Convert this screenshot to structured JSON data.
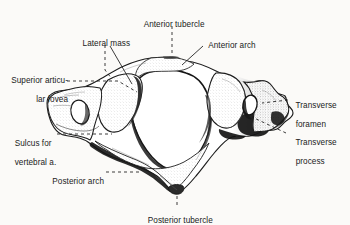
{
  "figure": {
    "view": "superior",
    "background_color": "#fbfaf8",
    "ink_color": "#1a1a1a",
    "style": "pen-and-ink anatomical line drawing with stipple shading"
  },
  "labels": [
    {
      "id": "anterior-tubercle",
      "text": "Anterior tubercle",
      "line1": "Anterior tubercle",
      "line2": ""
    },
    {
      "id": "lateral-mass",
      "text": "Lateral mass",
      "line1": "Lateral mass",
      "line2": ""
    },
    {
      "id": "anterior-arch",
      "text": "Anterior arch",
      "line1": "Anterior arch",
      "line2": ""
    },
    {
      "id": "superior-articular-fovea",
      "text": "Superior articular fovea",
      "line1": "Superior articu-",
      "line2": "lar fovea"
    },
    {
      "id": "transverse-foramen",
      "text": "Transverse foramen",
      "line1": "Transverse",
      "line2": "foramen"
    },
    {
      "id": "transverse-process",
      "text": "Transverse process",
      "line1": "Transverse",
      "line2": "process"
    },
    {
      "id": "sulcus-for-vertebral-artery",
      "text": "Sulcus for vertebral a.",
      "line1": "Sulcus for",
      "line2": "vertebral a."
    },
    {
      "id": "posterior-arch",
      "text": "Posterior arch",
      "line1": "Posterior arch",
      "line2": ""
    },
    {
      "id": "posterior-tubercle",
      "text": "Posterior tubercle",
      "line1": "Posterior tubercle",
      "line2": ""
    }
  ]
}
